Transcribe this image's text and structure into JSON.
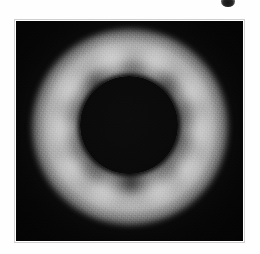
{
  "figure": {
    "name": "coronagraph-plate",
    "kind": "grayscale-astronomical-image",
    "page_background": "#fefefe",
    "plate_background": "#070707",
    "frame_color": "#cfcfcf",
    "corona_highlight_color": "#e4e4e4",
    "occulter_color": "#0a0a0a",
    "plate": {
      "left": 16,
      "top": 21,
      "width": 227,
      "height": 220
    },
    "occulter": {
      "center_x": 129,
      "center_y": 125,
      "radius": 49
    },
    "corona": {
      "peak_radius": 62,
      "outer_radius": 98
    },
    "scan_mark": {
      "name": "scan-artifact",
      "center_x": 228,
      "center_y": 1,
      "width": 14,
      "height": 11,
      "color": "#1a1a1a"
    },
    "streamer_lobes": [
      {
        "label": "NNW lobe",
        "angle_deg": 255,
        "distance": 64,
        "width": 60,
        "height": 50,
        "intensity": 0.95
      },
      {
        "label": "NNE lobe",
        "angle_deg": 292,
        "distance": 64,
        "width": 56,
        "height": 48,
        "intensity": 0.92
      },
      {
        "label": "ENE lobe",
        "angle_deg": 330,
        "distance": 66,
        "width": 52,
        "height": 50,
        "intensity": 0.8
      },
      {
        "label": "E lobe",
        "angle_deg": 4,
        "distance": 66,
        "width": 48,
        "height": 56,
        "intensity": 0.88
      },
      {
        "label": "ESE lobe",
        "angle_deg": 36,
        "distance": 66,
        "width": 52,
        "height": 50,
        "intensity": 0.82
      },
      {
        "label": "SSE lobe",
        "angle_deg": 66,
        "distance": 64,
        "width": 56,
        "height": 48,
        "intensity": 0.9
      },
      {
        "label": "SSW lobe",
        "angle_deg": 112,
        "distance": 64,
        "width": 58,
        "height": 48,
        "intensity": 0.88
      },
      {
        "label": "WSW lobe",
        "angle_deg": 146,
        "distance": 66,
        "width": 52,
        "height": 50,
        "intensity": 0.8
      },
      {
        "label": "W lobe",
        "angle_deg": 178,
        "distance": 64,
        "width": 48,
        "height": 58,
        "intensity": 0.96
      },
      {
        "label": "WNW lobe",
        "angle_deg": 212,
        "distance": 66,
        "width": 52,
        "height": 52,
        "intensity": 0.84
      }
    ],
    "dark_lanes": [
      {
        "label": "north polar lane",
        "angle_deg": 273,
        "distance": 66,
        "width": 12,
        "height": 64,
        "intensity": 0.7
      },
      {
        "label": "south polar lane",
        "angle_deg": 90,
        "distance": 66,
        "width": 14,
        "height": 60,
        "intensity": 0.6
      },
      {
        "label": "NE gap",
        "angle_deg": 315,
        "distance": 70,
        "width": 14,
        "height": 42,
        "intensity": 0.38
      },
      {
        "label": "SW gap",
        "angle_deg": 130,
        "distance": 70,
        "width": 14,
        "height": 42,
        "intensity": 0.34
      }
    ]
  }
}
